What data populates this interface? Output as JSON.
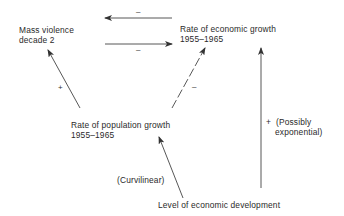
{
  "nodes": {
    "mass_violence": {
      "line1": "Mass violence",
      "line2": "decade 2"
    },
    "economic_growth": {
      "line1": "Rate of economic growth",
      "line2": "1955–1965"
    },
    "population_growth": {
      "line1": "Rate of population growth",
      "line2": "1955–1965"
    },
    "economic_development": {
      "line1": "Level of economic development"
    }
  },
  "edges": {
    "growth_to_violence": {
      "sign": "–"
    },
    "violence_to_growth": {
      "sign": "–"
    },
    "population_to_violence": {
      "sign": "+"
    },
    "population_to_growth": {
      "sign": "–",
      "style": "dashed"
    },
    "development_to_population": {
      "label": "(Curvilinear)"
    },
    "development_to_growth": {
      "sign": "+",
      "label_line1": "(Possibly",
      "label_line2": "exponential)"
    }
  },
  "colors": {
    "line": "#444444",
    "text": "#2a2a2a"
  }
}
